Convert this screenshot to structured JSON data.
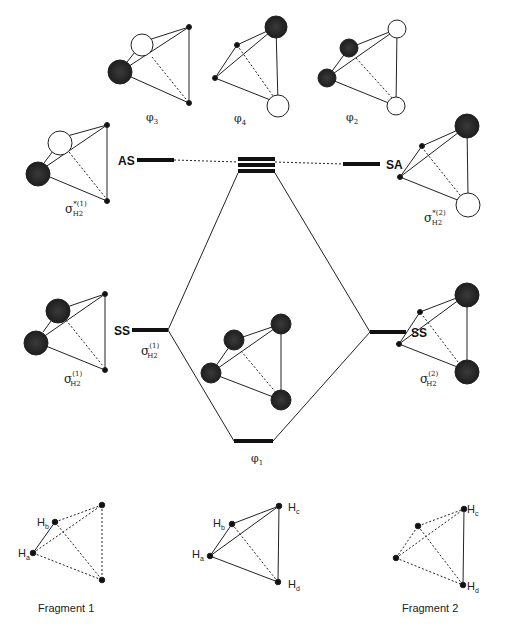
{
  "mo_labels": {
    "phi3": "φ3",
    "phi4": "φ4",
    "phi2": "φ2",
    "phi1": "φ1"
  },
  "levels": {
    "left_upper": "AS",
    "right_upper": "SA",
    "left_lower": "SS",
    "right_lower": "SS"
  },
  "fragment_orbitals": {
    "sigma_star_1": {
      "base": "σ",
      "sup": "*(1)",
      "sub": "H2"
    },
    "sigma_star_2": {
      "base": "σ",
      "sup": "*(2)",
      "sub": "H2"
    },
    "sigma_1": {
      "base": "σ",
      "sup": "(1)",
      "sub": "H2"
    },
    "sigma_1_level": {
      "base": "σ",
      "sup": "(1)",
      "sub": "H2"
    },
    "sigma_2": {
      "base": "σ",
      "sup": "(2)",
      "sub": "H2"
    }
  },
  "atoms": {
    "Ha": "H",
    "Ha_sub": "a",
    "Hb": "H",
    "Hb_sub": "b",
    "Hc": "H",
    "Hc_sub": "c",
    "Hd": "H",
    "Hd_sub": "d"
  },
  "fragments": {
    "f1": "Fragment  1",
    "f2": "Fragment  2"
  },
  "colors": {
    "filled_lobe": "#2a2a2a",
    "line": "#222222"
  }
}
